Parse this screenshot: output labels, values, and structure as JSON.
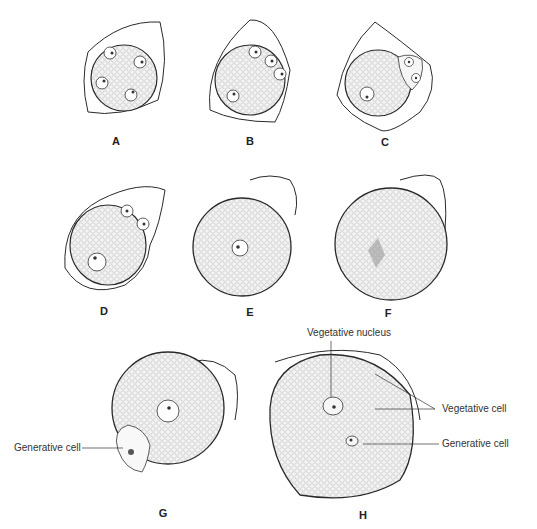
{
  "figure": {
    "panels": [
      {
        "id": "A",
        "label": "A",
        "stage": "microspore tetrad-like, four nuclei"
      },
      {
        "id": "B",
        "label": "B"
      },
      {
        "id": "C",
        "label": "C"
      },
      {
        "id": "D",
        "label": "D"
      },
      {
        "id": "E",
        "label": "E"
      },
      {
        "id": "F",
        "label": "F"
      },
      {
        "id": "G",
        "label": "G"
      },
      {
        "id": "H",
        "label": "H"
      }
    ],
    "annotations": {
      "g_generative_cell": "Generative cell",
      "h_vegetative_nucleus": "Vegetative nucleus",
      "h_vegetative_cell": "Vegetative cell",
      "h_generative_cell": "Generative cell"
    },
    "colors": {
      "line": "#2a2a2a",
      "stipple": "#c8c8c8",
      "background": "#ffffff"
    }
  }
}
